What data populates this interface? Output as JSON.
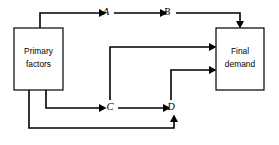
{
  "diagram": {
    "background_color": "#ffffff",
    "line_color": "#000000",
    "boxes": [
      {
        "id": "primary-factors",
        "label_line1": "Primary",
        "label_line2": "factors",
        "x": 14,
        "y": 28,
        "width": 49,
        "height": 62
      },
      {
        "id": "final-demand",
        "label_line1": "Final",
        "label_line2": "demand",
        "x": 216,
        "y": 28,
        "width": 48,
        "height": 62
      }
    ],
    "nodes": [
      {
        "id": "node-a",
        "label": "A",
        "x": 106,
        "y": 13
      },
      {
        "id": "node-b",
        "label": "B",
        "x": 167,
        "y": 13
      },
      {
        "id": "node-c",
        "label": "C",
        "x": 110,
        "y": 108
      },
      {
        "id": "node-d",
        "label": "D",
        "x": 171,
        "y": 108
      }
    ],
    "edges": [
      {
        "id": "edge-primary-to-a",
        "from": "primary-factors",
        "to": "node-a"
      },
      {
        "id": "edge-a-to-b",
        "from": "node-a",
        "to": "node-b"
      },
      {
        "id": "edge-b-to-final-demand",
        "from": "node-b",
        "to": "final-demand"
      },
      {
        "id": "edge-c-to-final-demand",
        "from": "node-c",
        "to": "final-demand"
      },
      {
        "id": "edge-d-to-final-demand",
        "from": "node-d",
        "to": "final-demand"
      },
      {
        "id": "edge-primary-to-c",
        "from": "primary-factors",
        "to": "node-c"
      },
      {
        "id": "edge-c-to-d",
        "from": "node-c",
        "to": "node-d"
      },
      {
        "id": "edge-primary-to-d",
        "from": "primary-factors",
        "to": "node-d"
      }
    ]
  }
}
